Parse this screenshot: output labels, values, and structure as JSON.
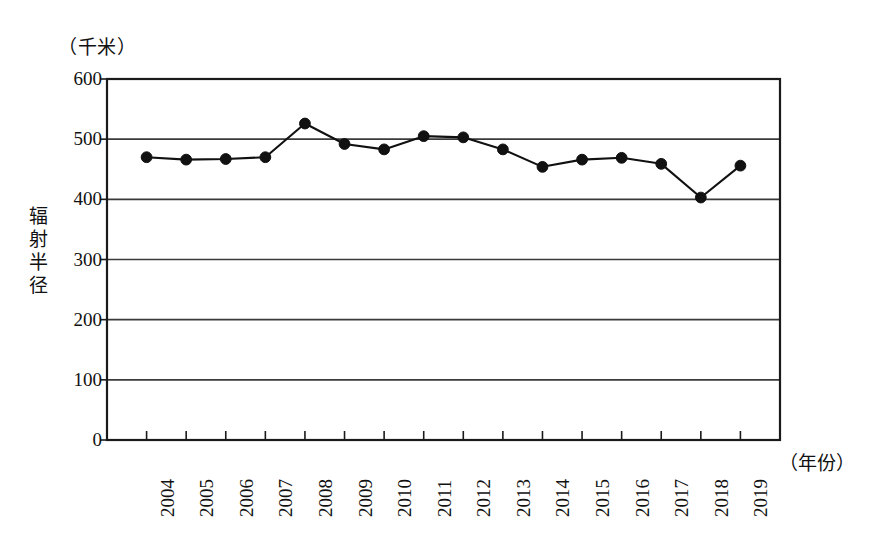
{
  "chart_data": {
    "type": "line",
    "title": "",
    "subtitle": "",
    "xlabel": "（年份）",
    "ylabel": "辐射半径",
    "unit_label": "（千米）",
    "categories": [
      "2004",
      "2005",
      "2006",
      "2007",
      "2008",
      "2009",
      "2010",
      "2011",
      "2012",
      "2013",
      "2014",
      "2015",
      "2016",
      "2017",
      "2018",
      "2019"
    ],
    "values": [
      470,
      466,
      467,
      470,
      526,
      492,
      483,
      505,
      503,
      483,
      454,
      466,
      469,
      459,
      403,
      456
    ],
    "series": [
      {
        "name": "辐射半径",
        "values": [
          470,
          466,
          467,
          470,
          526,
          492,
          483,
          505,
          503,
          483,
          454,
          466,
          469,
          459,
          403,
          456
        ]
      }
    ],
    "ylim": [
      0,
      600
    ],
    "y_ticks": [
      0,
      100,
      200,
      300,
      400,
      500,
      600
    ],
    "y_tick_labels": [
      "0",
      "100",
      "200",
      "300",
      "400",
      "500",
      "600"
    ],
    "grid": true,
    "grid_axis": "y",
    "legend": false,
    "legend_position": "none",
    "marker": "filled-circle",
    "line_color": "#111111",
    "marker_color": "#111111",
    "background_color": "#ffffff",
    "frame_color": "#1a1a1a"
  },
  "axes": {
    "y_unit_caption": "（千米）",
    "y_title_vertical": "辐射半径",
    "x_title": "（年份）"
  },
  "y_axis": {
    "ticks": [
      {
        "label": "600",
        "value": 600
      },
      {
        "label": "500",
        "value": 500
      },
      {
        "label": "400",
        "value": 400
      },
      {
        "label": "300",
        "value": 300
      },
      {
        "label": "200",
        "value": 200
      },
      {
        "label": "100",
        "value": 100
      },
      {
        "label": "0",
        "value": 0
      }
    ]
  },
  "x_axis": {
    "ticks": [
      {
        "label": "2004"
      },
      {
        "label": "2005"
      },
      {
        "label": "2006"
      },
      {
        "label": "2007"
      },
      {
        "label": "2008"
      },
      {
        "label": "2009"
      },
      {
        "label": "2010"
      },
      {
        "label": "2011"
      },
      {
        "label": "2012"
      },
      {
        "label": "2013"
      },
      {
        "label": "2014"
      },
      {
        "label": "2015"
      },
      {
        "label": "2016"
      },
      {
        "label": "2017"
      },
      {
        "label": "2018"
      },
      {
        "label": "2019"
      }
    ]
  }
}
